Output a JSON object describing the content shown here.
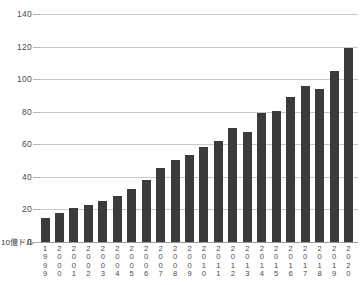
{
  "chart_data": {
    "type": "bar",
    "title": "",
    "subtitle": "",
    "xlabel": "",
    "ylabel": "10億ドル",
    "unit_label": "10億ドル",
    "ylim": [
      0,
      140
    ],
    "ytick_values": [
      140,
      120,
      100,
      80,
      60,
      40,
      20,
      0
    ],
    "ytick_labels": [
      "140",
      "120",
      "100",
      "80",
      "60",
      "40",
      "20",
      "0"
    ],
    "grid": true,
    "legend": null,
    "bar_color": "#3b3b3b",
    "gridline_color": "#c8c8c8",
    "axis_color": "#9a9a9a",
    "categories": [
      "1999",
      "2000",
      "2001",
      "2002",
      "2003",
      "2004",
      "2005",
      "2006",
      "2007",
      "2008",
      "2009",
      "2010",
      "2011",
      "2012",
      "2013",
      "2014",
      "2015",
      "2016",
      "2017",
      "2018",
      "2019",
      "2020"
    ],
    "values": [
      15,
      18,
      21,
      22.5,
      25,
      28,
      32.5,
      38,
      45.5,
      50.5,
      53.5,
      58.5,
      62,
      70,
      67.5,
      79,
      80.5,
      89,
      96,
      94,
      105,
      119
    ]
  }
}
